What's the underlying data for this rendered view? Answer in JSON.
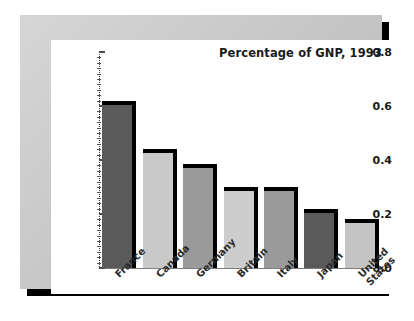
{
  "chart_data": {
    "type": "bar",
    "title": "Percentage of GNP, 1993",
    "xlabel": "",
    "ylabel": "",
    "ylim": [
      0.0,
      0.8
    ],
    "ytick_labels": [
      "0.0",
      "0.2",
      "0.4",
      "0.6",
      "0.8"
    ],
    "ytick_values": [
      0.0,
      0.2,
      0.4,
      0.6,
      0.8
    ],
    "grid": false,
    "legend": "none",
    "categories": [
      "France",
      "Canada",
      "Germany",
      "Britain",
      "Italy",
      "Japan",
      "United States"
    ],
    "category_lines": [
      [
        "France"
      ],
      [
        "Canada"
      ],
      [
        "Germany"
      ],
      [
        "Britain"
      ],
      [
        "Italy"
      ],
      [
        "Japan"
      ],
      [
        "United",
        "States"
      ]
    ],
    "values": [
      0.62,
      0.44,
      0.385,
      0.3,
      0.3,
      0.22,
      0.18
    ],
    "bar_colors": [
      "#5a5a5a",
      "#c9c9c9",
      "#9a9a9a",
      "#cdcdcd",
      "#9a9a9a",
      "#5a5a5a",
      "#c4c4c4"
    ]
  },
  "style": {
    "frame_color": "#c9c9c9",
    "canvas_color": "#ffffff",
    "shadow_color": "#000000",
    "axis_color": "#3a3a3a",
    "text_color": "#1a1a1a"
  }
}
